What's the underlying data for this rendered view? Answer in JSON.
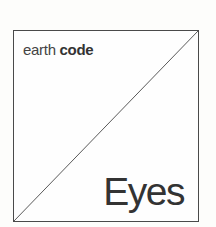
{
  "cover": {
    "series_prefix": "earth",
    "series_name": "code",
    "title": "Eyes",
    "colors": {
      "background": "#fdfdfb",
      "border": "#4a4a4a",
      "text": "#333333"
    }
  }
}
